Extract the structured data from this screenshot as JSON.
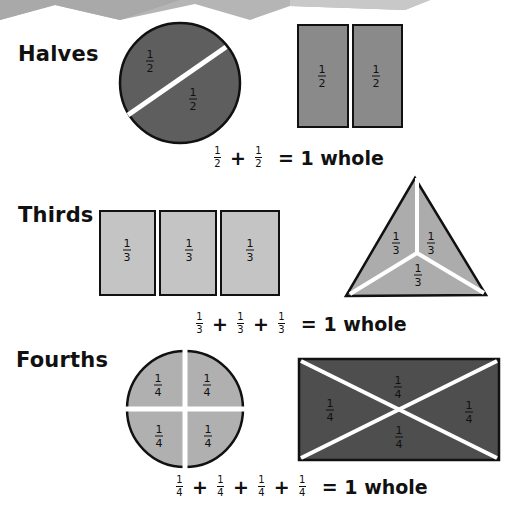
{
  "colors": {
    "halves_fill": "#5e5e5e",
    "halves_rect_fill": "#8a8a8a",
    "thirds_fill": "#c4c4c4",
    "thirds_triangle_fill": "#acacac",
    "fourths_circle_fill": "#b0b0b0",
    "fourths_rect_fill": "#4e4e4e",
    "outline": "#111111",
    "banner": "#b5b5b5"
  },
  "sections": [
    {
      "title": "Halves",
      "fraction": {
        "numerator": "1",
        "denominator": "2"
      },
      "shapes": [
        {
          "type": "circle",
          "parts": 2,
          "labels": [
            "1/2",
            "1/2"
          ]
        },
        {
          "type": "rectangle",
          "parts": 2,
          "labels": [
            "1/2",
            "1/2"
          ]
        }
      ],
      "equation": {
        "terms": 2,
        "operator": "+",
        "result": "= 1 whole"
      }
    },
    {
      "title": "Thirds",
      "fraction": {
        "numerator": "1",
        "denominator": "3"
      },
      "shapes": [
        {
          "type": "rectangle",
          "parts": 3,
          "labels": [
            "1/3",
            "1/3",
            "1/3"
          ]
        },
        {
          "type": "triangle",
          "parts": 3,
          "labels": [
            "1/3",
            "1/3",
            "1/3"
          ]
        }
      ],
      "equation": {
        "terms": 3,
        "operator": "+",
        "result": "= 1 whole"
      }
    },
    {
      "title": "Fourths",
      "fraction": {
        "numerator": "1",
        "denominator": "4"
      },
      "shapes": [
        {
          "type": "circle",
          "parts": 4,
          "labels": [
            "1/4",
            "1/4",
            "1/4",
            "1/4"
          ]
        },
        {
          "type": "rectangle",
          "parts": 4,
          "labels": [
            "1/4",
            "1/4",
            "1/4",
            "1/4"
          ]
        }
      ],
      "equation": {
        "terms": 4,
        "operator": "+",
        "result": "= 1 whole"
      }
    }
  ]
}
